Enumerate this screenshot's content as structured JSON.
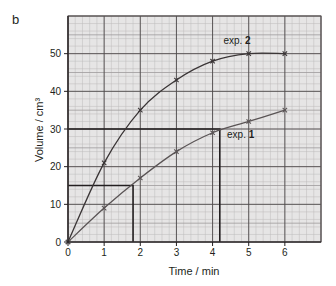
{
  "panel_label": "b",
  "chart_data": {
    "type": "line",
    "title": "",
    "xlabel": "Time / min",
    "ylabel": "Volume / cm³",
    "xlim": [
      0,
      7
    ],
    "ylim": [
      0,
      60
    ],
    "x_ticks": [
      0,
      1,
      2,
      3,
      4,
      5,
      6
    ],
    "y_ticks": [
      0,
      10,
      20,
      30,
      40,
      50
    ],
    "grid": true,
    "grid_minor_x": 0.2,
    "grid_minor_y": 2,
    "legend": "inline annotations",
    "series": [
      {
        "name": "exp. 2",
        "x": [
          0,
          1,
          2,
          3,
          4,
          5,
          6
        ],
        "values": [
          0,
          21,
          35,
          43,
          48,
          50,
          50
        ],
        "color": "#3a3536",
        "label_pos": [
          4.3,
          52.5
        ]
      },
      {
        "name": "exp. 1",
        "x": [
          0,
          1,
          2,
          3,
          4,
          5,
          6
        ],
        "values": [
          0,
          9,
          17,
          24,
          29,
          32,
          35
        ],
        "color": "#5a5455",
        "label_pos": [
          4.4,
          27.5
        ]
      }
    ],
    "annotations": [
      {
        "type": "guide",
        "y": 30,
        "x_end": 4.2,
        "note": "horizontal line at 30 cm³ to exp. 1 curve, vertical drop to t≈4.2"
      },
      {
        "type": "guide",
        "y": 15,
        "x_end": 1.8,
        "note": "horizontal line at 15 cm³ to exp. 1 curve, vertical drop to t≈1.8"
      }
    ]
  },
  "colors": {
    "grid_bg": "#e6e5e5",
    "grid_minor": "#bdbbbb",
    "grid_major": "#4d4849",
    "axis": "#231f20",
    "text": "#231f20"
  }
}
